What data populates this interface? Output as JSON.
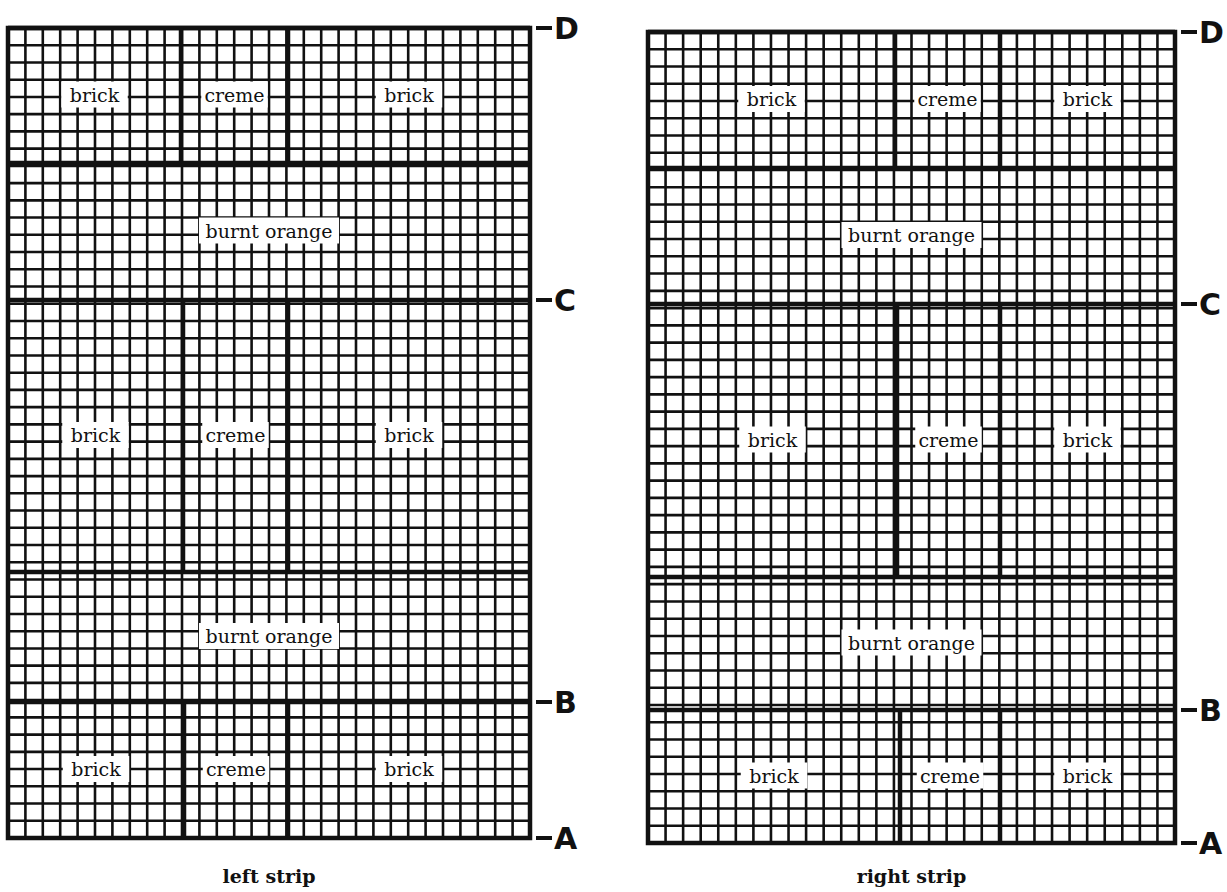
{
  "strips": [
    {
      "id": "left",
      "caption": "left strip",
      "x0": 8,
      "x1": 530,
      "y": {
        "D": 28,
        "C": 300,
        "B": 702,
        "A": 838
      },
      "rows": [
        {
          "y0": 28,
          "y1": 163,
          "labels": [
            "brick",
            "creme",
            "brick"
          ],
          "cols": [
            8,
            181,
            288,
            530
          ]
        },
        {
          "y0": 163,
          "y1": 300,
          "labels": [
            "burnt orange"
          ],
          "cols": [
            8,
            530
          ]
        },
        {
          "y0": 300,
          "y1": 572,
          "labels": [
            "brick",
            "creme",
            "brick"
          ],
          "cols": [
            8,
            183,
            288,
            530
          ]
        },
        {
          "y0": 572,
          "y1": 702,
          "labels": [
            "burnt orange"
          ],
          "cols": [
            8,
            530
          ]
        },
        {
          "y0": 702,
          "y1": 838,
          "labels": [
            "brick",
            "creme",
            "brick"
          ],
          "cols": [
            8,
            184,
            288,
            530
          ]
        }
      ]
    },
    {
      "id": "right",
      "caption": "right strip",
      "x0": 648,
      "x1": 1175,
      "y": {
        "D": 32,
        "C": 304,
        "B": 710,
        "A": 843
      },
      "rows": [
        {
          "y0": 32,
          "y1": 168,
          "labels": [
            "brick",
            "creme",
            "brick"
          ],
          "cols": [
            648,
            895,
            1000,
            1175
          ]
        },
        {
          "y0": 168,
          "y1": 304,
          "labels": [
            "burnt orange"
          ],
          "cols": [
            648,
            1175
          ]
        },
        {
          "y0": 304,
          "y1": 577,
          "labels": [
            "brick",
            "creme",
            "brick"
          ],
          "cols": [
            648,
            897,
            1000,
            1175
          ]
        },
        {
          "y0": 577,
          "y1": 710,
          "labels": [
            "burnt orange"
          ],
          "cols": [
            648,
            1175
          ]
        },
        {
          "y0": 710,
          "y1": 843,
          "labels": [
            "brick",
            "creme",
            "brick"
          ],
          "cols": [
            648,
            900,
            1000,
            1175
          ]
        }
      ]
    }
  ],
  "markers": [
    "D",
    "C",
    "B",
    "A"
  ],
  "grid_spacing": 17.4,
  "colors": {
    "ink": "#111111",
    "paper": "#ffffff"
  }
}
